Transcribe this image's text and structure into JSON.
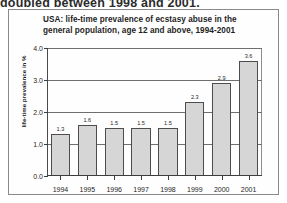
{
  "document_text": "doubled between 1998 and 2001.",
  "figure": {
    "title_line1": "USA: life-time prevalence of ecstasy abuse in the",
    "title_line2": "general population, age 12 and above, 1994-2001"
  },
  "chart_data": {
    "type": "bar",
    "title": "USA: life-time prevalence of ecstasy abuse in the general population, age 12 and above, 1994-2001",
    "xlabel": "",
    "ylabel": "life-time prevalence in %",
    "categories": [
      "1994",
      "1995",
      "1996",
      "1997",
      "1998",
      "1999",
      "2000",
      "2001"
    ],
    "values": [
      1.3,
      1.6,
      1.5,
      1.5,
      1.5,
      2.3,
      2.9,
      3.6
    ],
    "value_labels": [
      "1.3",
      "1.6",
      "1.5",
      "1.5",
      "1.5",
      "2.3",
      "2.9",
      "3.6"
    ],
    "ylim": [
      0.0,
      4.0
    ],
    "yticks": [
      0.0,
      1.0,
      2.0,
      3.0,
      4.0
    ],
    "ytick_labels": [
      "0.0",
      "1.0",
      "2.0",
      "3.0",
      "4.0"
    ],
    "grid": true,
    "legend": false,
    "bar_color": "#d6d6d6",
    "bar_edge_color": "#4d4d4d",
    "axis_color": "#3d3d3d",
    "grid_color": "#6f6f6f"
  }
}
